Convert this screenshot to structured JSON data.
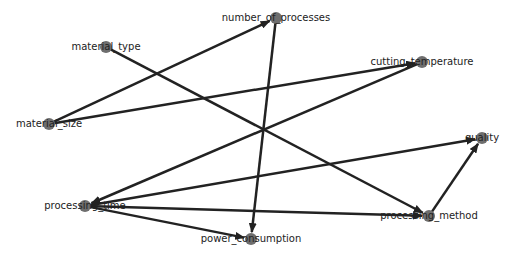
{
  "diagram": {
    "type": "directed-graph",
    "colors": {
      "edge": "#222222",
      "node_fill": "#6e6e6e",
      "label": "#222222",
      "background": "#ffffff"
    },
    "nodes": [
      {
        "id": "material_type",
        "label": "material_type",
        "x": 106,
        "y": 47
      },
      {
        "id": "number_of_processes",
        "label": "number_of_processes",
        "x": 276,
        "y": 18
      },
      {
        "id": "cutting_temperature",
        "label": "cutting_temperature",
        "x": 422,
        "y": 62
      },
      {
        "id": "material_size",
        "label": "material_size",
        "x": 49,
        "y": 124
      },
      {
        "id": "quality",
        "label": "quality",
        "x": 482,
        "y": 138
      },
      {
        "id": "processing_time",
        "label": "processing_time",
        "x": 85,
        "y": 206
      },
      {
        "id": "processing_method",
        "label": "processing_method",
        "x": 429,
        "y": 216
      },
      {
        "id": "power_consumption",
        "label": "power_consumption",
        "x": 251,
        "y": 239
      }
    ],
    "edges": [
      {
        "from": "material_size",
        "to": "number_of_processes"
      },
      {
        "from": "material_size",
        "to": "cutting_temperature"
      },
      {
        "from": "material_type",
        "to": "processing_method"
      },
      {
        "from": "number_of_processes",
        "to": "power_consumption"
      },
      {
        "from": "cutting_temperature",
        "to": "processing_time"
      },
      {
        "from": "processing_time",
        "to": "quality"
      },
      {
        "from": "processing_time",
        "to": "processing_method"
      },
      {
        "from": "processing_time",
        "to": "power_consumption"
      },
      {
        "from": "processing_method",
        "to": "quality"
      }
    ]
  }
}
